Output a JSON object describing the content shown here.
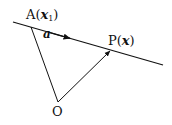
{
  "diagram": {
    "points": {
      "A": {
        "label": "A",
        "arg": "x",
        "arg_sub": "1",
        "pos": [
          31,
          27
        ]
      },
      "P": {
        "label": "P",
        "arg": "x",
        "pos": [
          110,
          51
        ]
      },
      "O": {
        "label": "O",
        "pos": [
          58,
          102
        ]
      }
    },
    "line": {
      "from": [
        13,
        22
      ],
      "to": [
        163,
        65
      ],
      "direction_label": "a"
    },
    "colors": {
      "stroke": "#111111",
      "background": "#ffffff"
    }
  }
}
